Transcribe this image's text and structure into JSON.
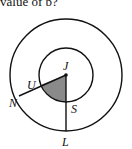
{
  "caption": "value of b?",
  "diagram": {
    "center": {
      "label": "J",
      "x": 66,
      "y": 75
    },
    "outer_circle_radius": 56,
    "inner_circle_radius": 27,
    "points": [
      {
        "label": "J",
        "role": "center"
      },
      {
        "label": "U",
        "role": "inner circle point on segment JN"
      },
      {
        "label": "N",
        "role": "outer circle point"
      },
      {
        "label": "S",
        "role": "inner circle point on segment JL"
      },
      {
        "label": "L",
        "role": "outer circle point"
      }
    ],
    "shaded_region": "sector JUS",
    "colors": {
      "stroke": "#111111",
      "shade": "#8a8a8a"
    }
  }
}
